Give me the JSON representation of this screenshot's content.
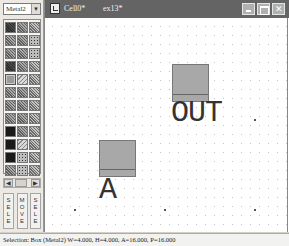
{
  "left_panel": {
    "layer_select": {
      "value": "Metal2",
      "dropdown_icon": "chevron-down-icon"
    },
    "palette": {
      "swatches": [
        {
          "pattern": "dark"
        },
        {
          "pattern": "mid"
        },
        {
          "pattern": "checker"
        },
        {
          "pattern": "mid"
        },
        {
          "pattern": "mid"
        },
        {
          "pattern": "dots"
        },
        {
          "pattern": "mid"
        },
        {
          "pattern": "mid"
        },
        {
          "pattern": "dots"
        },
        {
          "pattern": "dark"
        },
        {
          "pattern": "mid"
        },
        {
          "pattern": "checker"
        },
        {
          "pattern": "selected"
        },
        {
          "pattern": "light"
        },
        {
          "pattern": "checker"
        },
        {
          "pattern": "mid"
        },
        {
          "pattern": "mid"
        },
        {
          "pattern": "checker"
        },
        {
          "pattern": "mid"
        },
        {
          "pattern": "mid"
        },
        {
          "pattern": "checker"
        },
        {
          "pattern": "mid"
        },
        {
          "pattern": "mid"
        },
        {
          "pattern": "checker"
        },
        {
          "pattern": "solid"
        },
        {
          "pattern": "mid"
        },
        {
          "pattern": "checker"
        },
        {
          "pattern": "solid"
        },
        {
          "pattern": "light"
        },
        {
          "pattern": "checker"
        },
        {
          "pattern": "solid"
        },
        {
          "pattern": "dots"
        },
        {
          "pattern": "checker"
        },
        {
          "pattern": "mid"
        },
        {
          "pattern": "dots"
        },
        {
          "pattern": "checker"
        }
      ],
      "selected_layer": "Metal2"
    },
    "tool_buttons": [
      {
        "label": "SELE",
        "letters": [
          "S",
          "E",
          "L",
          "E"
        ]
      },
      {
        "label": "MOVE",
        "letters": [
          "M",
          "O",
          "V",
          "E"
        ]
      },
      {
        "label": "SELE",
        "letters": [
          "S",
          "E",
          "L",
          "E"
        ]
      }
    ]
  },
  "document": {
    "tabs": [
      {
        "label": "Cell0*",
        "active": true
      },
      {
        "label": "ex13*",
        "active": false
      }
    ],
    "window_controls": {
      "minimize": "minimize-icon",
      "maximize": "maximize-icon",
      "close": "✕"
    },
    "canvas": {
      "shapes": [
        {
          "type": "box",
          "layer": "Metal2",
          "label": "OUT"
        },
        {
          "type": "box",
          "layer": "Metal2",
          "label": "A"
        }
      ]
    }
  },
  "status_bar": {
    "text": "Selection: Box (Metal2) W=4.000, H=4.000, A=16.000, P=16.000"
  }
}
